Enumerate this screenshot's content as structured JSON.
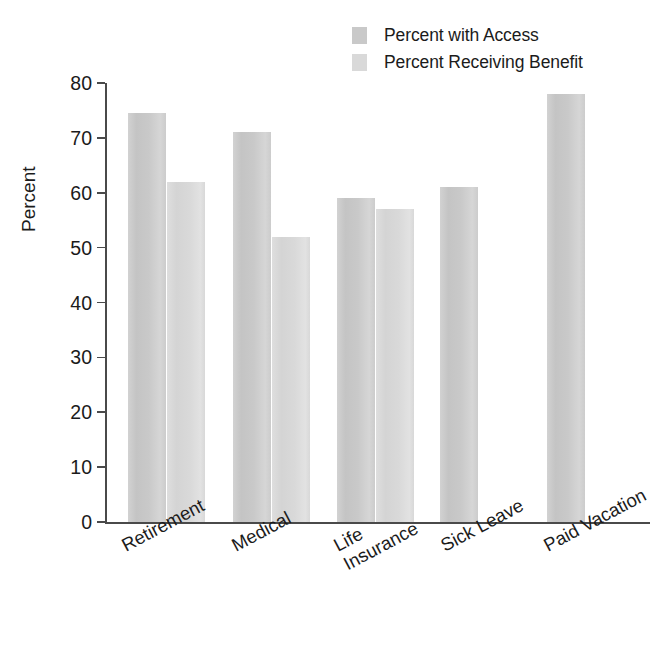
{
  "chart_data": {
    "type": "bar",
    "title": "",
    "subtitle": "",
    "xlabel": "",
    "ylabel": "Percent",
    "ylim": [
      0,
      80
    ],
    "yticks": [
      0,
      10,
      20,
      30,
      40,
      50,
      60,
      70,
      80
    ],
    "grid": false,
    "legend_position": "top-right",
    "categories": [
      "Retirement",
      "Medical",
      "Life Insurance",
      "Sick Leave",
      "Paid Vacation"
    ],
    "category_label_lines": [
      [
        "Retirement"
      ],
      [
        "Medical"
      ],
      [
        "Life",
        "Insurance"
      ],
      [
        "Sick Leave"
      ],
      [
        "Paid Vacation"
      ]
    ],
    "series": [
      {
        "name": "Percent with Access",
        "color": "#c9c9c9",
        "values": [
          74.5,
          71,
          59,
          61,
          78
        ]
      },
      {
        "name": "Percent Receiving Benefit",
        "color": "#d9d9d9",
        "values": [
          62,
          52,
          57,
          null,
          null
        ]
      }
    ]
  },
  "legend": {
    "items": [
      {
        "label": "Percent with Access",
        "color": "#c9c9c9"
      },
      {
        "label": "Percent Receiving Benefit",
        "color": "#d9d9d9"
      }
    ]
  },
  "axes": {
    "y_title": "Percent",
    "y_tick_labels": [
      "80",
      "70",
      "60",
      "50",
      "40",
      "30",
      "20",
      "10",
      "0"
    ]
  }
}
